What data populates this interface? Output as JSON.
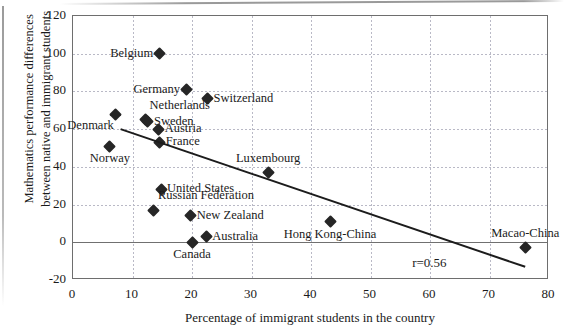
{
  "chart_data": {
    "type": "scatter",
    "title": "",
    "xlabel": "Percentage of immigrant students in the country",
    "ylabel": "Mathematics performance differences between native and immigrant students",
    "ylabel_lines": [
      "Mathematics performance differences",
      "between native and immigrant students"
    ],
    "xlim": [
      0,
      80
    ],
    "ylim": [
      -20,
      120
    ],
    "xticks": [
      0,
      10,
      20,
      30,
      40,
      50,
      60,
      70,
      80
    ],
    "yticks": [
      -20,
      0,
      20,
      40,
      60,
      80,
      100,
      120
    ],
    "xtick_labels": [
      "0",
      "10",
      "20",
      "30",
      "40",
      "50",
      "60",
      "70",
      "80"
    ],
    "ytick_labels": [
      "-20",
      "0",
      "20",
      "40",
      "60",
      "80",
      "100",
      "120"
    ],
    "grid": true,
    "legend": false,
    "annotations": [
      {
        "text": "r=0.56",
        "x": 57,
        "y": -11
      }
    ],
    "trendline": {
      "type": "linear",
      "x_start": 8,
      "y_start": 60,
      "x_end": 76,
      "y_end": -13
    },
    "marker_shape": "diamond",
    "marker_color": "#262626",
    "points": [
      {
        "label": "Belgium",
        "x": 14.5,
        "y": 100,
        "label_pos": "left"
      },
      {
        "label": "Germany",
        "x": 19.0,
        "y": 81,
        "label_pos": "left"
      },
      {
        "label": "Switzerland",
        "x": 22.6,
        "y": 76,
        "label_pos": "right"
      },
      {
        "label": "Denmark",
        "x": 7.2,
        "y": 68,
        "label_pos": "below-left"
      },
      {
        "label": "Netherlands",
        "x": 12.2,
        "y": 65,
        "label_pos": "above-right"
      },
      {
        "label": "Sweden",
        "x": 12.6,
        "y": 64,
        "label_pos": "right"
      },
      {
        "label": "Austria",
        "x": 14.4,
        "y": 60,
        "label_pos": "right"
      },
      {
        "label": "France",
        "x": 14.6,
        "y": 53,
        "label_pos": "right"
      },
      {
        "label": "Norway",
        "x": 6.2,
        "y": 51,
        "label_pos": "below"
      },
      {
        "label": "Luxembourg",
        "x": 32.8,
        "y": 37,
        "label_pos": "above"
      },
      {
        "label": "United States",
        "x": 14.8,
        "y": 28,
        "label_pos": "right"
      },
      {
        "label": "Russian Federation",
        "x": 13.6,
        "y": 17,
        "label_pos": "above-right"
      },
      {
        "label": "New Zealand",
        "x": 19.8,
        "y": 14,
        "label_pos": "right"
      },
      {
        "label": "Hong Kong-China",
        "x": 43.2,
        "y": 11,
        "label_pos": "below"
      },
      {
        "label": "Australia",
        "x": 22.4,
        "y": 3,
        "label_pos": "right"
      },
      {
        "label": "Canada",
        "x": 20.0,
        "y": 0,
        "label_pos": "below"
      },
      {
        "label": "Macao-China",
        "x": 76.0,
        "y": -3,
        "label_pos": "above"
      }
    ]
  }
}
